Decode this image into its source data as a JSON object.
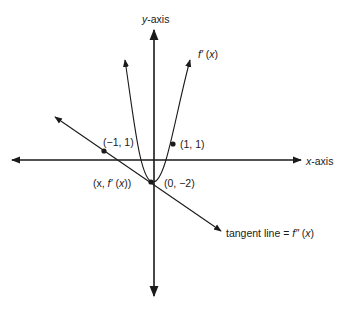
{
  "diagram": {
    "axes": {
      "x_label_var": "x",
      "x_label_rest": "-axis",
      "y_label_var": "y",
      "y_label_rest": "-axis"
    },
    "curve": {
      "label_fn": "f′",
      "label_arg": "x",
      "type": "parabola"
    },
    "points": [
      {
        "label": "(−1, 1)"
      },
      {
        "label": "(1, 1)"
      },
      {
        "label": "(0, −2)"
      },
      {
        "label_prefix": "(x, ",
        "label_fn": "f′",
        "label_arg": "x",
        "label_suffix": ")"
      }
    ],
    "tangent": {
      "label_text": "tangent line = ",
      "label_fn": "f″",
      "label_arg": "x"
    },
    "colors": {
      "stroke": "#1a1a1a",
      "background": "#ffffff"
    }
  }
}
